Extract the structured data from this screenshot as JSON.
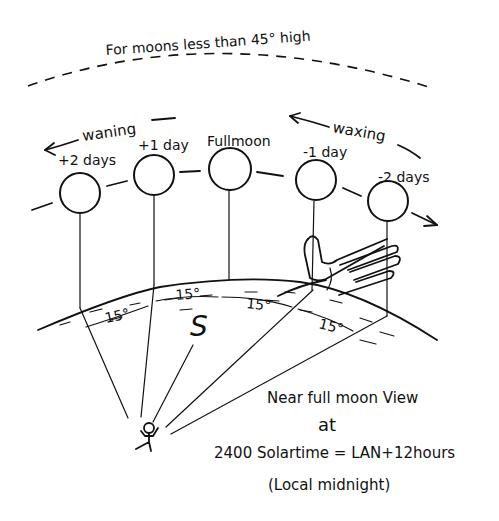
{
  "diagram": {
    "top_note": "For moons less than 45° high",
    "direction_labels": {
      "waning": "waning",
      "waxing": "waxing"
    },
    "moons": [
      {
        "label": "+2 days",
        "cx": 80,
        "cy": 193,
        "stem_bottom_x": 80,
        "stem_bottom_y": 308
      },
      {
        "label": "+1 day",
        "cx": 155,
        "cy": 175,
        "stem_bottom_x": 154,
        "stem_bottom_y": 285
      },
      {
        "label": "Fullmoon",
        "cx": 230,
        "cy": 169,
        "stem_bottom_x": 229,
        "stem_bottom_y": 280
      },
      {
        "label": "-1 day",
        "cx": 316,
        "cy": 180,
        "stem_bottom_x": 313,
        "stem_bottom_y": 290
      },
      {
        "label": "-2 days",
        "cx": 389,
        "cy": 200,
        "stem_bottom_x": 387,
        "stem_bottom_y": 316
      }
    ],
    "angle_labels": [
      "15°",
      "15°",
      "15°",
      "15°"
    ],
    "ground_symbol": "S",
    "caption": {
      "line1": "Near full moon View",
      "line2": "at",
      "line3": "2400 Solartime = LAN+12hours",
      "line4": "(Local midnight)"
    },
    "colors": {
      "ink": "#111111",
      "paper": "#ffffff"
    }
  }
}
